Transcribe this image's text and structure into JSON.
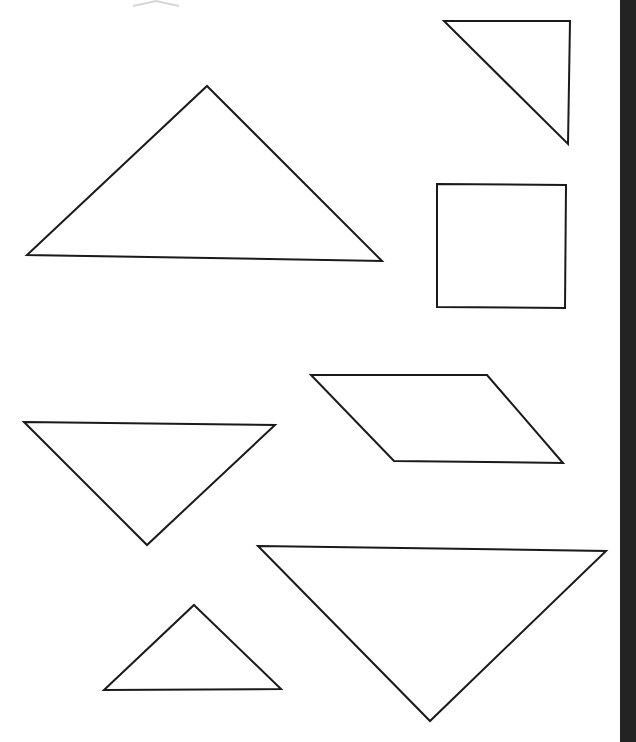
{
  "canvas": {
    "width": 636,
    "height": 742,
    "background_color": "#ffffff",
    "stroke_color": "#1a1a1a",
    "faint_stroke_color": "#d6d6d8",
    "description": "Scanned worksheet page of plain geometric line drawings"
  },
  "right_edge_band": {
    "name": "scanner-edge-shadow",
    "color": "#232323",
    "left": 620,
    "width": 16
  },
  "shapes": [
    {
      "id": "shape-partial-top",
      "name": "partial-shape-top-edge",
      "type": "partial",
      "faint": true,
      "points": "133,6 156,1 179,6"
    },
    {
      "id": "shape-large-triangle-top-left",
      "name": "large-triangle-top-left",
      "type": "triangle",
      "faint": false,
      "points": "207,86 382,261 27,255"
    },
    {
      "id": "shape-right-triangle-top-right",
      "name": "right-triangle-top-right",
      "type": "right-triangle",
      "faint": false,
      "points": "444,21 570,21 568,144"
    },
    {
      "id": "shape-square-right",
      "name": "square-right",
      "type": "square",
      "faint": false,
      "points": "437,184 566,185 565,308 437,307"
    },
    {
      "id": "shape-parallelogram-middle-right",
      "name": "parallelogram-middle-right",
      "type": "parallelogram",
      "faint": false,
      "points": "311,375 487,375 563,463 394,461"
    },
    {
      "id": "shape-inverted-triangle-middle-left",
      "name": "inverted-triangle-middle-left",
      "type": "triangle",
      "faint": false,
      "points": "24,422 275,425 147,545"
    },
    {
      "id": "shape-large-inverted-triangle-bottom-right",
      "name": "large-inverted-triangle-bottom-right",
      "type": "triangle",
      "faint": false,
      "points": "258,546 606,551 430,721"
    },
    {
      "id": "shape-small-triangle-bottom-left",
      "name": "small-triangle-bottom-left",
      "type": "triangle",
      "faint": false,
      "points": "194,605 281,689 104,690"
    }
  ],
  "chart_data": {
    "type": "table",
    "categories": [
      "large-triangle-top-left",
      "right-triangle-top-right",
      "square-right",
      "parallelogram-middle-right",
      "inverted-triangle-middle-left",
      "large-inverted-triangle-bottom-right",
      "small-triangle-bottom-left"
    ],
    "values": [
      3,
      3,
      4,
      4,
      3,
      3,
      3
    ],
    "xlabel": "shape",
    "ylabel": "number of sides"
  }
}
